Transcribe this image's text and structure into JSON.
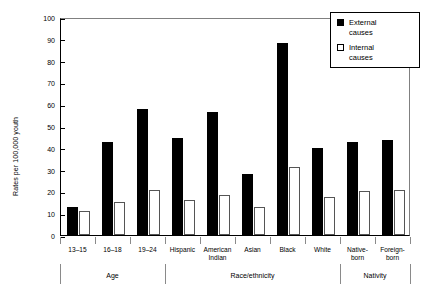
{
  "chart_data": {
    "type": "bar",
    "title": "",
    "xlabel": "",
    "ylabel": "Rates per 100,000 youth",
    "ylim": [
      0,
      100
    ],
    "yticks": [
      0,
      10,
      20,
      30,
      40,
      50,
      60,
      70,
      80,
      90,
      100
    ],
    "grid": false,
    "legend_position": "top-right",
    "categories": [
      "13–15",
      "16–18",
      "19–24",
      "Hispanic",
      "American Indian",
      "Asian",
      "Black",
      "White",
      "Native-born",
      "Foreign-born"
    ],
    "series": [
      {
        "name": "External causes",
        "color": "#000000",
        "values": [
          13,
          42.5,
          58,
          44.5,
          56.5,
          28,
          88,
          40,
          42.5,
          43.5
        ]
      },
      {
        "name": "Internal causes",
        "color": "#ffffff",
        "values": [
          11,
          15,
          20.5,
          16,
          18.5,
          13,
          31,
          17.5,
          20,
          20.5
        ]
      }
    ],
    "groups": [
      {
        "label": "Age",
        "categories": [
          "13–15",
          "16–18",
          "19–24"
        ]
      },
      {
        "label": "Race/ethnicity",
        "categories": [
          "Hispanic",
          "American Indian",
          "Asian",
          "Black",
          "White"
        ]
      },
      {
        "label": "Nativity",
        "categories": [
          "Native-born",
          "Foreign-born"
        ]
      }
    ]
  },
  "legend": {
    "items": [
      {
        "label_line1": "External",
        "label_line2": "causes",
        "swatch": "filled-square"
      },
      {
        "label_line1": "Internal",
        "label_line2": "causes",
        "swatch": "hollow-square"
      }
    ]
  },
  "category_labels": [
    {
      "line1": "13–15",
      "line2": ""
    },
    {
      "line1": "16–18",
      "line2": ""
    },
    {
      "line1": "19–24",
      "line2": ""
    },
    {
      "line1": "Hispanic",
      "line2": ""
    },
    {
      "line1": "American",
      "line2": "Indian"
    },
    {
      "line1": "Asian",
      "line2": ""
    },
    {
      "line1": "Black",
      "line2": ""
    },
    {
      "line1": "White",
      "line2": ""
    },
    {
      "line1": "Native-",
      "line2": "born"
    },
    {
      "line1": "Foreign-",
      "line2": "born"
    }
  ]
}
